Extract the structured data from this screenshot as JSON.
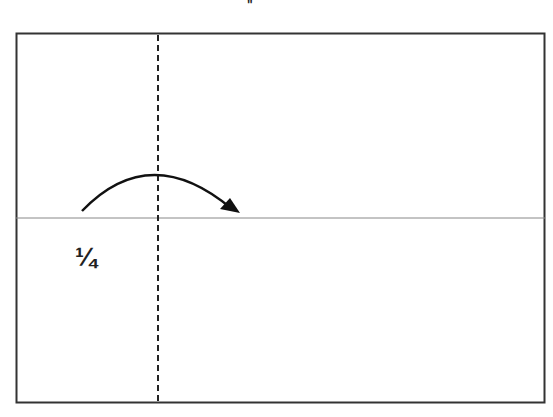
{
  "diagram": {
    "top_mark": "\"",
    "fold_label": "¼",
    "colors": {
      "border": "#333333",
      "fold_line": "#888888",
      "dashed_line": "#222222",
      "arrow": "#111111"
    },
    "sheet": {
      "x": 16,
      "y": 33,
      "width": 529,
      "height": 370
    },
    "horizontal_fold_y": 218,
    "vertical_dashed_x": 158,
    "arrow": {
      "start": [
        82,
        211
      ],
      "control": [
        150,
        140
      ],
      "end": [
        238,
        212
      ],
      "direction": "right"
    }
  }
}
